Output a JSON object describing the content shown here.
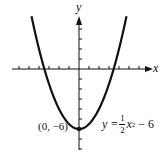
{
  "chart_data": {
    "type": "line",
    "title": "",
    "xlabel": "x",
    "ylabel": "y",
    "equation_label": "y = 1/2 x^2 - 6",
    "vertex_label": "(0, -6)",
    "function": "y = 0.5*x^2 - 6",
    "xlim": [
      -7,
      7
    ],
    "ylim": [
      -8,
      7
    ],
    "x_ticks": [
      -6,
      -5,
      -4,
      -3,
      -2,
      -1,
      1,
      2,
      3,
      4,
      5,
      6,
      7,
      8
    ],
    "y_ticks": [
      -8,
      -7,
      -6,
      -5,
      -4,
      -3,
      -2,
      -1,
      1,
      2,
      3,
      4,
      5
    ],
    "grid": false,
    "series": [
      {
        "name": "y = 1/2 x^2 - 6",
        "x": [
          -4.7,
          -4,
          -3.46,
          -3,
          -2,
          -1,
          0,
          1,
          2,
          3,
          3.46,
          4,
          4.7
        ],
        "y": [
          5.05,
          2,
          0,
          -1.5,
          -4,
          -5.5,
          -6,
          -5.5,
          -4,
          -1.5,
          0,
          2,
          5.05
        ]
      }
    ],
    "points": [
      {
        "x": 0,
        "y": -6,
        "label": "(0, -6)"
      }
    ],
    "x_intercepts": [
      -3.46,
      3.46
    ]
  },
  "labels": {
    "x_axis": "x",
    "y_axis": "y",
    "vertex": "(0, −6)",
    "eq_lhs": "y =",
    "eq_num": "1",
    "eq_den": "2",
    "eq_var": "x",
    "eq_exp": "2",
    "eq_rest": "− 6"
  },
  "colors": {
    "ink": "#111111",
    "background": "#ffffff"
  }
}
